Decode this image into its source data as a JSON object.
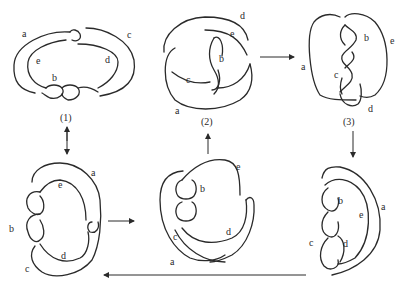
{
  "figure": {
    "panels": [
      {
        "id": "p1",
        "caption": "(1)",
        "labels": {
          "a": "a",
          "c": "c",
          "e": "e",
          "d": "d",
          "b": "b"
        }
      },
      {
        "id": "p2",
        "caption": "(2)",
        "labels": {
          "d": "d",
          "e": "e",
          "b": "b",
          "c": "c",
          "a": "a"
        }
      },
      {
        "id": "p3",
        "caption": "(3)",
        "labels": {
          "b": "b",
          "e": "e",
          "a": "a",
          "c": "c",
          "d": "d"
        }
      },
      {
        "id": "p4",
        "caption": "",
        "labels": {
          "a": "a",
          "e": "e",
          "b": "b",
          "d": "d",
          "c": "c"
        }
      },
      {
        "id": "p5",
        "caption": "",
        "labels": {
          "e": "e",
          "b": "b",
          "c": "c",
          "d": "d",
          "a": "a"
        }
      },
      {
        "id": "p6",
        "caption": "",
        "labels": {
          "b": "b",
          "a": "a",
          "e": "e",
          "c": "c",
          "d": "d"
        }
      }
    ],
    "arrows": [
      {
        "from": "p1",
        "to": "p4",
        "type": "bidirectional-vertical"
      },
      {
        "from": "p4",
        "to": "p5",
        "type": "right"
      },
      {
        "from": "p5",
        "to": "p2",
        "type": "up"
      },
      {
        "from": "p2",
        "to": "p3",
        "type": "right"
      },
      {
        "from": "p3",
        "to": "p6",
        "type": "down"
      },
      {
        "from": "p6",
        "to": "p4",
        "type": "left-long"
      }
    ],
    "ink_color": "#2a2a2a",
    "background": "#ffffff"
  }
}
